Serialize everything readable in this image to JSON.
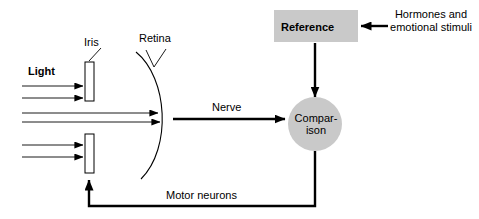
{
  "figure": {
    "background_color": "#ffffff",
    "stroke_color": "#000000",
    "shape_fill_gray": "#c9c9c9"
  },
  "labels": {
    "iris": "Iris",
    "retina": "Retina",
    "light": "Light",
    "nerve": "Nerve",
    "motor_neurons": "Motor neurons",
    "reference": "Reference",
    "comparison_line1": "Compar-",
    "comparison_line2": "ison",
    "hormones": "Hormones and emotional stimuli"
  },
  "nodes": [
    {
      "name": "reference",
      "shape": "rectangle",
      "fill": "#c9c9c9",
      "label": "Reference"
    },
    {
      "name": "comparison",
      "shape": "circle",
      "fill": "#c9c9c9",
      "label": "Comparison"
    },
    {
      "name": "iris-upper",
      "shape": "rectangle",
      "fill": "#ffffff",
      "label": "Iris"
    },
    {
      "name": "iris-lower",
      "shape": "rectangle",
      "fill": "#ffffff",
      "label": "Iris"
    },
    {
      "name": "retina",
      "shape": "arc",
      "fill": "none",
      "label": "Retina"
    }
  ],
  "connections": [
    {
      "from": "light",
      "to": "iris-upper",
      "label": "Light",
      "arrow": true
    },
    {
      "from": "light",
      "to": "iris-lower",
      "label": "Light",
      "arrow": true
    },
    {
      "from": "iris",
      "to": "retina",
      "label": "",
      "arrow": true
    },
    {
      "from": "retina",
      "to": "comparison",
      "label": "Nerve",
      "arrow": true
    },
    {
      "from": "reference",
      "to": "comparison",
      "label": "",
      "arrow": true
    },
    {
      "from": "hormones",
      "to": "reference",
      "label": "Hormones and emotional stimuli",
      "arrow": true
    },
    {
      "from": "comparison",
      "to": "iris-lower",
      "label": "Motor neurons",
      "arrow": true
    }
  ]
}
